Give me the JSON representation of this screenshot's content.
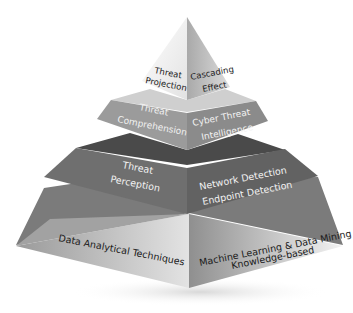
{
  "diagram": {
    "type": "pyramid",
    "tiers": [
      {
        "level": 1,
        "left_label": [
          "Threat",
          "Projection"
        ],
        "right_label": [
          "Cascading",
          "Effect"
        ]
      },
      {
        "level": 2,
        "left_label": [
          "Threat",
          "Comprehension"
        ],
        "right_label": [
          "Cyber Threat",
          "Intelligence"
        ]
      },
      {
        "level": 3,
        "left_label": [
          "Threat",
          "Perception"
        ],
        "right_label": [
          "Network Detection",
          "Endpoint Detection"
        ]
      },
      {
        "level": 4,
        "left_label": [
          "Data Analytical Techniques"
        ],
        "right_label": [
          "Machine Learning & Data Mining",
          "Knowledge-based"
        ]
      }
    ],
    "colors": {
      "tier1_left": "#f4f4f4",
      "tier1_right": "#b9b9b9",
      "tier2_left": "#9a9a9a",
      "tier2_right": "#8a8a8a",
      "tier2_top": "#d0d0d0",
      "tier3_left": "#6e6e6e",
      "tier3_right": "#636363",
      "tier3_top": "#4a4a4a",
      "tier4_left": "#bdbdbd",
      "tier4_right": "#a8a8a8",
      "tier4_top": "#7b7b7b"
    }
  }
}
